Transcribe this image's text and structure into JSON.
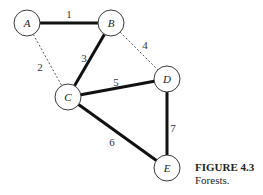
{
  "figure": {
    "title": "FIGURE 4.3",
    "subtitle": "Forests."
  },
  "graph": {
    "nodes": [
      {
        "id": "A",
        "label": "A"
      },
      {
        "id": "B",
        "label": "B"
      },
      {
        "id": "C",
        "label": "C"
      },
      {
        "id": "D",
        "label": "D"
      },
      {
        "id": "E",
        "label": "E"
      }
    ],
    "edges": [
      {
        "from": "A",
        "to": "B",
        "weight": "1",
        "style": "solid"
      },
      {
        "from": "A",
        "to": "C",
        "weight": "2",
        "style": "dashed"
      },
      {
        "from": "B",
        "to": "C",
        "weight": "3",
        "style": "solid"
      },
      {
        "from": "B",
        "to": "D",
        "weight": "4",
        "style": "dashed"
      },
      {
        "from": "C",
        "to": "D",
        "weight": "5",
        "style": "solid"
      },
      {
        "from": "C",
        "to": "E",
        "weight": "6",
        "style": "solid"
      },
      {
        "from": "D",
        "to": "E",
        "weight": "7",
        "style": "solid"
      }
    ]
  }
}
